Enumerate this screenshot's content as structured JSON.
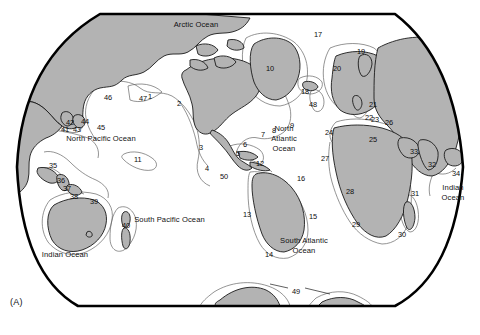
{
  "figure": {
    "panel_label": "(A)",
    "type": "world-map-diagram",
    "projection": "rounded-rectangular world map",
    "colors": {
      "land_fill": "#b3b3b3",
      "land_stroke": "#1a1a1a",
      "shelf_stroke": "#555555",
      "ocean_fill": "#ffffff",
      "frame_stroke": "#000000",
      "text": "#111111"
    }
  },
  "ocean_labels": [
    {
      "id": "arctic-ocean",
      "text": "Arctic Ocean",
      "x": 196,
      "y": 25
    },
    {
      "id": "north-pacific-ocean",
      "text": "North Pacific Ocean",
      "x": 101,
      "y": 139
    },
    {
      "id": "north-atlantic-ocean",
      "line1": "North",
      "line2": "Atlantic",
      "line3": "Ocean",
      "x": 283,
      "y": 128
    },
    {
      "id": "south-pacific-ocean",
      "text": "South Pacific Ocean",
      "x": 169,
      "y": 220
    },
    {
      "id": "south-atlantic-ocean",
      "line1": "South Atlantic",
      "line2": "Ocean",
      "x": 304,
      "y": 241
    },
    {
      "id": "indian-ocean-east",
      "line1": "Indian",
      "line2": "Ocean",
      "x": 453,
      "y": 188
    },
    {
      "id": "indian-ocean-west",
      "text": "Indian Ocean",
      "x": 65,
      "y": 255
    }
  ],
  "numbered_labels": [
    {
      "n": "1",
      "x": 148,
      "y": 93
    },
    {
      "n": "2",
      "x": 177,
      "y": 100
    },
    {
      "n": "3",
      "x": 199,
      "y": 144
    },
    {
      "n": "4",
      "x": 205,
      "y": 165
    },
    {
      "n": "5",
      "x": 236,
      "y": 150
    },
    {
      "n": "6",
      "x": 243,
      "y": 141
    },
    {
      "n": "7",
      "x": 261,
      "y": 131
    },
    {
      "n": "8",
      "x": 272,
      "y": 127
    },
    {
      "n": "9",
      "x": 290,
      "y": 122
    },
    {
      "n": "10",
      "x": 266,
      "y": 65
    },
    {
      "n": "11",
      "x": 134,
      "y": 156
    },
    {
      "n": "12",
      "x": 256,
      "y": 160
    },
    {
      "n": "13",
      "x": 243,
      "y": 211
    },
    {
      "n": "14",
      "x": 265,
      "y": 251
    },
    {
      "n": "15",
      "x": 309,
      "y": 213
    },
    {
      "n": "16",
      "x": 297,
      "y": 175
    },
    {
      "n": "17",
      "x": 314,
      "y": 31
    },
    {
      "n": "18",
      "x": 301,
      "y": 88
    },
    {
      "n": "19",
      "x": 357,
      "y": 48
    },
    {
      "n": "20",
      "x": 333,
      "y": 65
    },
    {
      "n": "21",
      "x": 369,
      "y": 101
    },
    {
      "n": "22",
      "x": 365,
      "y": 114
    },
    {
      "n": "23",
      "x": 371,
      "y": 116
    },
    {
      "n": "24",
      "x": 325,
      "y": 129
    },
    {
      "n": "25",
      "x": 369,
      "y": 136
    },
    {
      "n": "26",
      "x": 385,
      "y": 119
    },
    {
      "n": "27",
      "x": 321,
      "y": 155
    },
    {
      "n": "28",
      "x": 346,
      "y": 188
    },
    {
      "n": "29",
      "x": 352,
      "y": 221
    },
    {
      "n": "30",
      "x": 398,
      "y": 231
    },
    {
      "n": "31",
      "x": 411,
      "y": 190
    },
    {
      "n": "32",
      "x": 428,
      "y": 161
    },
    {
      "n": "33",
      "x": 410,
      "y": 148
    },
    {
      "n": "34",
      "x": 452,
      "y": 170
    },
    {
      "n": "35",
      "x": 49,
      "y": 162
    },
    {
      "n": "36",
      "x": 57,
      "y": 177
    },
    {
      "n": "37",
      "x": 63,
      "y": 185
    },
    {
      "n": "38",
      "x": 70,
      "y": 193
    },
    {
      "n": "39",
      "x": 90,
      "y": 198
    },
    {
      "n": "40",
      "x": 122,
      "y": 222
    },
    {
      "n": "41",
      "x": 61,
      "y": 126
    },
    {
      "n": "42",
      "x": 66,
      "y": 119
    },
    {
      "n": "43",
      "x": 73,
      "y": 126
    },
    {
      "n": "44",
      "x": 81,
      "y": 118
    },
    {
      "n": "45",
      "x": 97,
      "y": 124
    },
    {
      "n": "46",
      "x": 104,
      "y": 94
    },
    {
      "n": "47",
      "x": 139,
      "y": 95
    },
    {
      "n": "48",
      "x": 309,
      "y": 101
    },
    {
      "n": "49",
      "x": 292,
      "y": 288
    },
    {
      "n": "50",
      "x": 220,
      "y": 173
    }
  ]
}
